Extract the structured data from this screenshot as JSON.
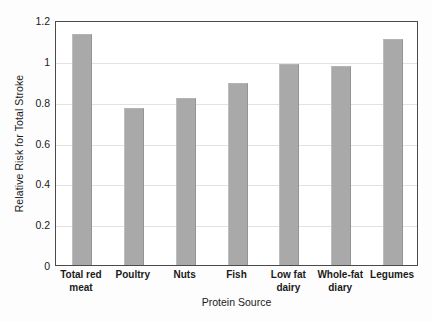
{
  "chart_data": {
    "type": "bar",
    "title": "",
    "subtitle": "",
    "xlabel": "Protein Source",
    "ylabel": "Relative Risk for Total Stroke",
    "categories": [
      "Total red meat",
      "Poultry",
      "Nuts",
      "Fish",
      "Low fat dairy",
      "Whole-fat diary",
      "Legumes"
    ],
    "category_lines": [
      [
        "Total red",
        "meat"
      ],
      [
        "Poultry"
      ],
      [
        "Nuts"
      ],
      [
        "Fish"
      ],
      [
        "Low fat",
        "dairy"
      ],
      [
        "Whole-fat",
        "diary"
      ],
      [
        "Legumes"
      ]
    ],
    "values": [
      1.13,
      0.77,
      0.82,
      0.89,
      0.985,
      0.975,
      1.105
    ],
    "ylim": [
      0,
      1.2
    ],
    "ytick_values": [
      0,
      0.2,
      0.4,
      0.6,
      0.8,
      1.0,
      1.2
    ],
    "ytick_labels": [
      "0",
      "0.2",
      "0.4",
      "0.6",
      "0.8",
      "1",
      "1.2"
    ],
    "grid": true,
    "grid_axis": "y",
    "legend": false,
    "legend_position": "none",
    "bar_color": "#a9a9a9",
    "axis_color": "#4a4a4a",
    "gridline_color": "#e2e2e2",
    "plot_background": "#ffffff"
  }
}
